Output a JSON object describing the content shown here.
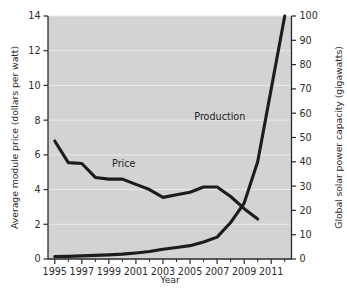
{
  "chart_data": {
    "type": "line",
    "title": "",
    "xlabel": "Year",
    "ylabel": "Average module price (dollars per watt)",
    "ylabel_right": "Global solar power capacity (gigawatts)",
    "grid": true,
    "legend_position": "inline-annotations",
    "xlim": [
      1994.5,
      2012.5
    ],
    "ylim": [
      0,
      14
    ],
    "ylim_right": [
      0,
      100
    ],
    "x_tick_labels": [
      "1995",
      "1997",
      "1999",
      "2001",
      "2003",
      "2005",
      "2007",
      "2009",
      "2011"
    ],
    "x_tick_values": [
      1995,
      1997,
      1999,
      2001,
      2003,
      2005,
      2007,
      2009,
      2011
    ],
    "x_minor_tick_values": [
      1996,
      1998,
      2000,
      2002,
      2004,
      2006,
      2008,
      2010,
      2012
    ],
    "y_tick_labels_left": [
      "0",
      "2",
      "4",
      "6",
      "8",
      "10",
      "12",
      "14"
    ],
    "y_tick_values_left": [
      0,
      2,
      4,
      6,
      8,
      10,
      12,
      14
    ],
    "y_tick_labels_right": [
      "0",
      "10",
      "20",
      "30",
      "40",
      "50",
      "60",
      "70",
      "80",
      "90",
      "100"
    ],
    "y_tick_values_right": [
      0,
      10,
      20,
      30,
      40,
      50,
      60,
      70,
      80,
      90,
      100
    ],
    "series": [
      {
        "name": "Price",
        "axis": "left",
        "units": "dollars per watt",
        "annotation": "Price",
        "x": [
          1995,
          1996,
          1997,
          1998,
          1999,
          2000,
          2001,
          2002,
          2003,
          2004,
          2005,
          2006,
          2007,
          2008,
          2009,
          2010
        ],
        "values": [
          6.8,
          5.55,
          5.5,
          4.7,
          4.6,
          4.6,
          4.3,
          4.0,
          3.55,
          3.7,
          3.85,
          4.15,
          4.15,
          3.6,
          2.9,
          2.3
        ]
      },
      {
        "name": "Production",
        "axis": "right",
        "units": "gigawatts",
        "annotation": "Production",
        "x": [
          1995,
          1996,
          1997,
          1998,
          1999,
          2000,
          2001,
          2002,
          2003,
          2004,
          2005,
          2006,
          2007,
          2008,
          2009,
          2010,
          2011,
          2012
        ],
        "values": [
          1.0,
          1.1,
          1.3,
          1.5,
          1.7,
          2.0,
          2.5,
          3.1,
          4.0,
          4.7,
          5.5,
          7.0,
          9.0,
          15.0,
          23.0,
          40.0,
          70.0,
          100.0
        ]
      }
    ],
    "annotations": [
      {
        "text": "Price",
        "x": 2000.1,
        "y_left": 5.3
      },
      {
        "text": "Production",
        "x": 2007.2,
        "y_left": 8.0
      }
    ],
    "colors": {
      "plot_background": "#d3d3d3",
      "line": "#1c1c1c",
      "gridline": "#eceaea",
      "axis": "#2a2a2a",
      "text": "#2b2b2b"
    }
  }
}
